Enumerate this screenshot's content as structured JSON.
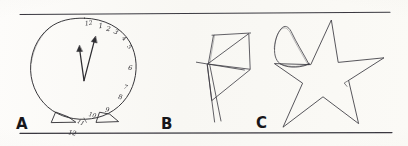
{
  "figure": {
    "background_color": "#fbfaf7",
    "ink_color": "#2b2a2e",
    "rule_color": "#3a3940",
    "width": 408,
    "height": 146
  },
  "rules": {
    "top": {
      "y": 14,
      "x1": 20,
      "x2": 390
    },
    "bottom": {
      "y": 133,
      "x1": 20,
      "x2": 392
    }
  },
  "panels": [
    {
      "id": "a",
      "label": "A",
      "drawing": "clock",
      "title": "Clock drawing with all numerals crowded into the right half",
      "numerals": [
        "12",
        "1",
        "2",
        "3",
        "4",
        "5",
        "6",
        "7",
        "8",
        "9",
        "10",
        "11",
        "12"
      ],
      "hands": 2,
      "feet": 2
    },
    {
      "id": "b",
      "label": "B",
      "drawing": "kite",
      "title": "Kite drawn as an angular quadrilateral with crossing spars and a two-line tail",
      "tail_lines": 2
    },
    {
      "id": "c",
      "label": "C",
      "drawing": "star",
      "title": "Five-pointed star with an extra closed loop overdrawn on the upper-left point",
      "points": 5,
      "extra_loop": 1
    }
  ],
  "clock_numerals": [
    {
      "text": "12",
      "x": 89,
      "y": 25,
      "rot": -8,
      "size": 6.0
    },
    {
      "text": "1",
      "x": 101,
      "y": 28,
      "rot": -4,
      "size": 7.0
    },
    {
      "text": "2",
      "x": 108,
      "y": 31,
      "rot": 12,
      "size": 6.5
    },
    {
      "text": "3",
      "x": 115,
      "y": 34,
      "rot": 26,
      "size": 6.5
    },
    {
      "text": "4",
      "x": 123,
      "y": 40,
      "rot": 40,
      "size": 6.0
    },
    {
      "text": "5",
      "x": 128,
      "y": 48,
      "rot": 52,
      "size": 6.0
    },
    {
      "text": "6",
      "x": 130,
      "y": 70,
      "rot": 6,
      "size": 6.5
    },
    {
      "text": "7",
      "x": 125,
      "y": 89,
      "rot": 16,
      "size": 6.0
    },
    {
      "text": "8",
      "x": 120,
      "y": 99,
      "rot": 10,
      "size": 6.5
    },
    {
      "text": "9",
      "x": 107,
      "y": 112,
      "rot": 8,
      "size": 6.5
    },
    {
      "text": "10",
      "x": 92,
      "y": 117,
      "rot": 14,
      "size": 6.0
    },
    {
      "text": "11",
      "x": 80,
      "y": 124,
      "rot": 26,
      "size": 5.5
    },
    {
      "text": "12",
      "x": 72,
      "y": 135,
      "rot": 10,
      "size": 6.5
    }
  ]
}
